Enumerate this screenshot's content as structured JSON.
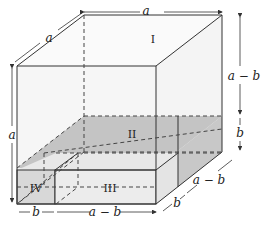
{
  "diagram": {
    "type": "3d-cube-decomposition",
    "regions": [
      {
        "id": "I",
        "label": "I"
      },
      {
        "id": "II",
        "label": "II"
      },
      {
        "id": "III",
        "label": "III"
      },
      {
        "id": "IV",
        "label": "IV"
      }
    ],
    "dimensions": {
      "top_width": "a",
      "top_depth": "a",
      "left_height": "a",
      "right_upper_height": "a − b",
      "right_lower_height": "b",
      "bottom_left_width": "b",
      "bottom_right_width": "a − b",
      "depth_front": "b",
      "depth_back": "a − b"
    },
    "colors": {
      "line": "#333333",
      "shade_light": "#e6e6e6",
      "shade_dark": "#bdbdbd",
      "face": "#f7f7f7"
    }
  }
}
